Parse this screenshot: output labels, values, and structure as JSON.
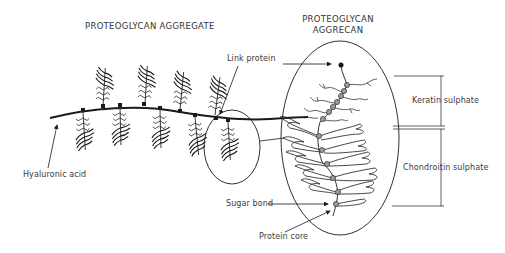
{
  "titles": {
    "aggregate": "PROTEOGLYCAN AGGREGATE",
    "aggrecan_line1": "PROTEOGLYCAN",
    "aggrecan_line2": "AGGRECAN"
  },
  "labels": {
    "link_protein": "Link protein",
    "hyaluronic_acid": "Hyaluronic acid",
    "sugar_bond": "Sugar bond",
    "protein_core": "Protein core",
    "keratin_sulphate": "Keratin sulphate",
    "chondroitin_sulphate": "Chondroitin sulphate"
  },
  "colors": {
    "ink": "#1a1a1a",
    "text": "#3a3a3a",
    "bead": "#9a9a9a"
  }
}
